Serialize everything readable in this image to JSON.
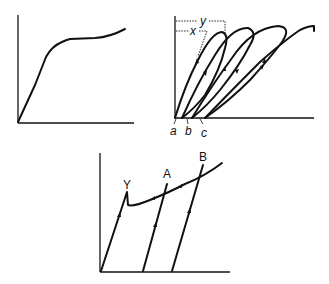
{
  "diagrams": [
    {
      "id": "stress-strain-monotonic",
      "description": "Monotonic stress-strain curve with linear rise then gradual hardening plateau",
      "labels": []
    },
    {
      "id": "stress-strain-hysteresis-loops",
      "description": "Repeated loading-unloading hysteresis loops shifting along strain axis",
      "labels": {
        "x": "x",
        "y": "y",
        "a": "a",
        "b": "b",
        "c": "c"
      }
    },
    {
      "id": "stress-strain-yield-point",
      "description": "Curve with upper yield point Y followed by drop, strain hardening through A and B with unloading lines",
      "labels": {
        "Y": "Y",
        "A": "A",
        "B": "B"
      }
    }
  ],
  "colors": {
    "line": "#111111",
    "background": "#ffffff"
  }
}
